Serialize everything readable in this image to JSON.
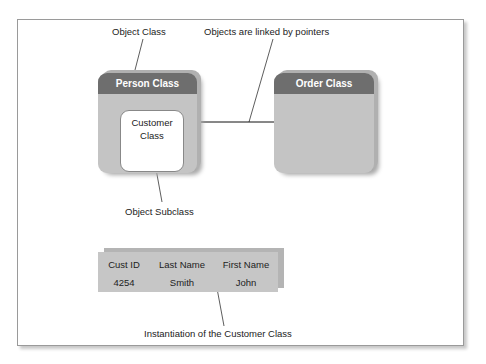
{
  "diagram": {
    "callouts": {
      "object_class": "Object Class",
      "linked_by_pointers": "Objects are linked by pointers",
      "object_subclass": "Object Subclass",
      "instantiation": "Instantiation of the Customer Class"
    },
    "classes": {
      "person": {
        "title": "Person Class",
        "subclass": {
          "line1": "Customer",
          "line2": "Class"
        }
      },
      "order": {
        "title": "Order Class"
      }
    },
    "instance_table": {
      "headers": [
        "Cust ID",
        "Last Name",
        "First Name"
      ],
      "rows": [
        [
          "4254",
          "Smith",
          "John"
        ]
      ]
    },
    "colors": {
      "header": "#6e6e6e",
      "body": "#c4c4c4",
      "frame": "#9a9a9a"
    }
  }
}
